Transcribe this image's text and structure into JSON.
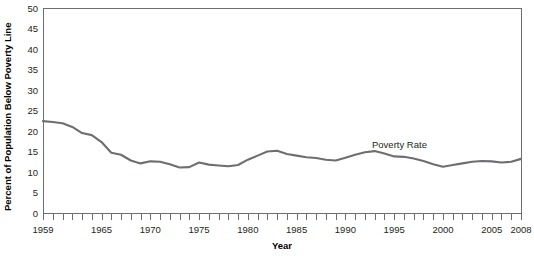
{
  "chart_data": {
    "type": "line",
    "title": "",
    "xlabel": "Year",
    "ylabel": "Percent of Population Below Poverty Line",
    "xlim": [
      1959,
      2008
    ],
    "ylim": [
      0,
      50
    ],
    "ytick_step": 5,
    "yticks": [
      0,
      5,
      10,
      15,
      20,
      25,
      30,
      35,
      40,
      45,
      50
    ],
    "ytick_labels": [
      "0",
      "5",
      "10",
      "15",
      "20",
      "25",
      "30",
      "35",
      "40",
      "45",
      "50"
    ],
    "xticks": [
      1959,
      1960,
      1961,
      1962,
      1963,
      1964,
      1965,
      1966,
      1967,
      1968,
      1969,
      1970,
      1971,
      1972,
      1973,
      1974,
      1975,
      1976,
      1977,
      1978,
      1979,
      1980,
      1981,
      1982,
      1983,
      1984,
      1985,
      1986,
      1987,
      1988,
      1989,
      1990,
      1991,
      1992,
      1993,
      1994,
      1995,
      1996,
      1997,
      1998,
      1999,
      2000,
      2001,
      2002,
      2003,
      2004,
      2005,
      2006,
      2007,
      2008
    ],
    "xtick_labels_shown": [
      "1959",
      "1965",
      "1970",
      "1975",
      "1980",
      "1985",
      "1990",
      "1995",
      "2000",
      "2005",
      "2008"
    ],
    "grid": false,
    "legend_position": "inline-annotation",
    "series": [
      {
        "name": "Poverty Rate",
        "color": "#6d6e71",
        "annotation": "Poverty Rate",
        "x": [
          1959,
          1960,
          1961,
          1962,
          1963,
          1964,
          1965,
          1966,
          1967,
          1968,
          1969,
          1970,
          1971,
          1972,
          1973,
          1974,
          1975,
          1976,
          1977,
          1978,
          1979,
          1980,
          1981,
          1982,
          1983,
          1984,
          1985,
          1986,
          1987,
          1988,
          1989,
          1990,
          1991,
          1992,
          1993,
          1994,
          1995,
          1996,
          1997,
          1998,
          1999,
          2000,
          2001,
          2002,
          2003,
          2004,
          2005,
          2006,
          2007,
          2008
        ],
        "values": [
          22.4,
          22.2,
          21.9,
          21.0,
          19.5,
          19.0,
          17.3,
          14.7,
          14.2,
          12.8,
          12.1,
          12.6,
          12.5,
          11.9,
          11.1,
          11.2,
          12.3,
          11.8,
          11.6,
          11.4,
          11.7,
          13.0,
          14.0,
          15.0,
          15.2,
          14.4,
          14.0,
          13.6,
          13.4,
          13.0,
          12.8,
          13.5,
          14.2,
          14.8,
          15.1,
          14.5,
          13.8,
          13.7,
          13.3,
          12.7,
          11.9,
          11.3,
          11.7,
          12.1,
          12.5,
          12.7,
          12.6,
          12.3,
          12.5,
          13.2
        ]
      }
    ]
  },
  "plot_geometry": {
    "left": 43,
    "right": 521,
    "top": 8,
    "bottom": 213
  }
}
